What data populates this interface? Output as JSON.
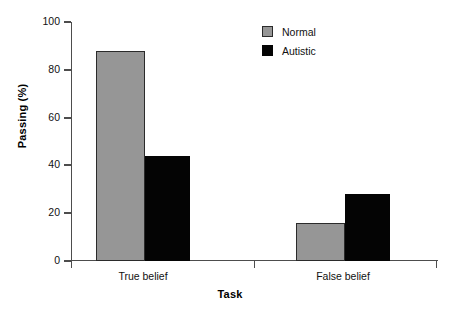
{
  "chart_data": {
    "type": "bar",
    "title": "",
    "subtitle": "",
    "xlabel": "Task",
    "ylabel": "Passing (%)",
    "categories": [
      "True belief",
      "False belief"
    ],
    "series": [
      {
        "name": "Normal",
        "values": [
          88,
          16
        ],
        "color": "#969696"
      },
      {
        "name": "Autistic",
        "values": [
          44,
          28
        ],
        "color": "#040404"
      }
    ],
    "ylim": [
      0,
      100
    ],
    "yticks": [
      0,
      20,
      40,
      60,
      80,
      100
    ],
    "ytick_labels": [
      "0",
      "20",
      "40",
      "60",
      "80",
      "100"
    ],
    "grid": false,
    "legend_position": "top-right",
    "legend_entries": [
      "Normal",
      "Autistic"
    ],
    "annotations": []
  },
  "axes": {
    "y_title": "Passing (%)",
    "x_title": "Task",
    "y_tick_labels": [
      "100",
      "80",
      "60",
      "40",
      "20",
      "0"
    ],
    "x_tick_labels": [
      "True belief",
      "False belief"
    ]
  },
  "legend": {
    "items": [
      {
        "label": "Normal",
        "swatch": "gray-square-icon"
      },
      {
        "label": "Autistic",
        "swatch": "black-square-icon"
      }
    ]
  }
}
